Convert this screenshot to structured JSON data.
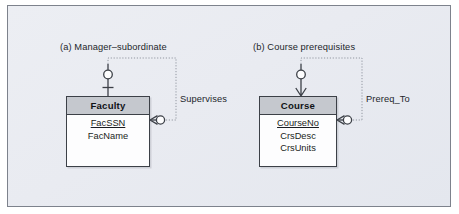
{
  "figure": {
    "background_color": "#e9ebf1",
    "frame_border_color": "#7d828c",
    "line_color": "#3c4047",
    "dotted_line_color": "#8b9099",
    "header_fill": "#c5c8ce"
  },
  "panels": [
    {
      "caption": "(a) Manager–subordinate",
      "relationship_label": "Supervises",
      "entity": {
        "name": "Faculty",
        "attributes": [
          {
            "label": "FacSSN",
            "is_primary_key": true
          },
          {
            "label": "FacName",
            "is_primary_key": false
          }
        ]
      },
      "cardinality": {
        "parent_end": "zero-or-one",
        "child_end": "zero-or-many"
      }
    },
    {
      "caption": "(b) Course prerequisites",
      "relationship_label": "Prereq_To",
      "entity": {
        "name": "Course",
        "attributes": [
          {
            "label": "CourseNo",
            "is_primary_key": true
          },
          {
            "label": "CrsDesc",
            "is_primary_key": false
          },
          {
            "label": "CrsUnits",
            "is_primary_key": false
          }
        ]
      },
      "cardinality": {
        "parent_end": "zero-or-many",
        "child_end": "zero-or-many"
      }
    }
  ]
}
